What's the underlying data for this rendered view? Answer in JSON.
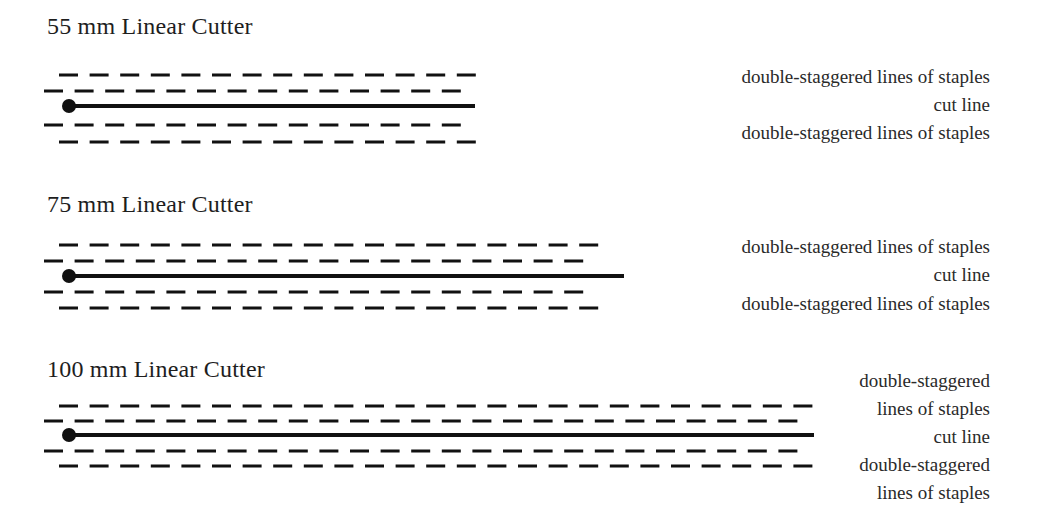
{
  "colors": {
    "ink": "#111111",
    "text": "#222222",
    "background": "#ffffff"
  },
  "cutters": [
    {
      "title": "55 mm Linear Cutter",
      "title_top": 12,
      "rows_y": [
        75,
        91,
        106,
        125,
        142
      ],
      "end_x": 475,
      "labels": [
        {
          "text": "double-staggered lines of staples",
          "center_y": 77
        },
        {
          "text": "cut line",
          "center_y": 105
        },
        {
          "text": "double-staggered lines of staples",
          "center_y": 133
        }
      ]
    },
    {
      "title": "75 mm Linear Cutter",
      "title_top": 190,
      "rows_y": [
        245,
        261,
        276,
        292,
        308
      ],
      "end_x": 624,
      "labels": [
        {
          "text": "double-staggered lines of staples",
          "center_y": 247
        },
        {
          "text": "cut line",
          "center_y": 275
        },
        {
          "text": "double-staggered lines of staples",
          "center_y": 304
        }
      ]
    },
    {
      "title": "100 mm Linear Cutter",
      "title_top": 355,
      "rows_y": [
        406,
        421,
        435,
        451,
        466
      ],
      "end_x": 814,
      "labels": [
        {
          "text": "double-staggered",
          "center_y": 381
        },
        {
          "text": "lines of staples",
          "center_y": 409
        },
        {
          "text": "cut line",
          "center_y": 437
        },
        {
          "text": "double-staggered",
          "center_y": 465
        },
        {
          "text": "lines of staples",
          "center_y": 493
        }
      ]
    }
  ],
  "geometry": {
    "outer_start_x": 59,
    "inner_start_x": 44,
    "inner_end_offset": 14,
    "dash_length": 19,
    "dash_period": 30.6,
    "dash_thickness": 3,
    "cut_start_x": 69,
    "cut_thickness": 4,
    "dot_radius": 7
  }
}
